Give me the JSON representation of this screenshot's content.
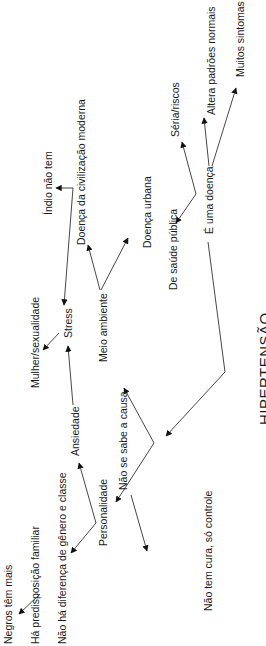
{
  "diagram": {
    "title": "HIPERTENSÃO",
    "orientation": "rotated 90° counter-clockwise",
    "nodes": {
      "negros": "Negros têm mais",
      "predisposicao": "Há predisposição familiar",
      "nao_diferenca": "Não há diferença de gênero e classe",
      "personalidade": "Personalidade",
      "ansiedade": "Ansiedade",
      "mulher": "Mulher/sexualidade",
      "stress": "Stress",
      "indio": "Índio não tem",
      "civilizacao": "Doença da civilização moderna",
      "meio_ambiente": "Meio ambiente",
      "urbana": "Doença urbana",
      "nao_sabe_causa": "Não se sabe a causa",
      "nao_tem_cura": "Não tem cura, só controle",
      "saude_publica": "De saúde pública",
      "uma_doenca": "É uma doença",
      "seria": "Séria/riscos",
      "altera": "Altera padrões normais",
      "sintomas": "Muitos sintomas"
    },
    "edges": [
      {
        "from": "HIPERTENSÃO",
        "to": "É uma doença"
      },
      {
        "from": "HIPERTENSÃO",
        "to": "Não se sabe a causa"
      },
      {
        "from": "É uma doença",
        "to": "De saúde pública"
      },
      {
        "from": "É uma doença",
        "to": "Séria/riscos"
      },
      {
        "from": "É uma doença",
        "to": "Altera padrões normais"
      },
      {
        "from": "É uma doença",
        "to": "Muitos sintomas"
      },
      {
        "from": "Não se sabe a causa",
        "to": "Não tem cura, só controle"
      },
      {
        "from": "Não se sabe a causa",
        "to": "Meio ambiente"
      },
      {
        "from": "Não se sabe a causa",
        "to": "Personalidade"
      },
      {
        "from": "Meio ambiente",
        "to": "Doença da civilização moderna"
      },
      {
        "from": "Meio ambiente",
        "to": "Doença urbana"
      },
      {
        "from": "Personalidade",
        "to": "Ansiedade"
      },
      {
        "from": "Personalidade",
        "to": "Não há diferença de gênero e classe"
      },
      {
        "from": "Ansiedade",
        "to": "Stress"
      },
      {
        "from": "Stress",
        "to": "Mulher/sexualidade"
      },
      {
        "from": "Índio não tem",
        "to": "Stress"
      },
      {
        "from": "Há predisposição familiar",
        "to": "Negros têm mais"
      }
    ]
  }
}
